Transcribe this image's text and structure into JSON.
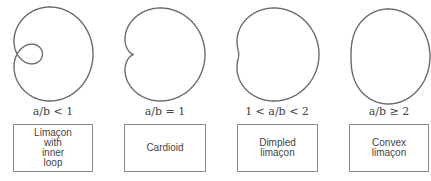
{
  "figure": {
    "panels": [
      {
        "condition": "a/b < 1",
        "name": "Limaçon\nwith\ninner\nloop",
        "a": 0.5,
        "b": 1
      },
      {
        "condition": "a/b = 1",
        "name": "Cardioid",
        "a": 1,
        "b": 1
      },
      {
        "condition": "1 < a/b < 2",
        "name": "Dimpled\nlimaçon",
        "a": 1.5,
        "b": 1
      },
      {
        "condition": "a/b ≥ 2",
        "name": "Convex\nlimaçon",
        "a": 2.2,
        "b": 1
      }
    ],
    "stroke_color": "#6b6b6b"
  }
}
